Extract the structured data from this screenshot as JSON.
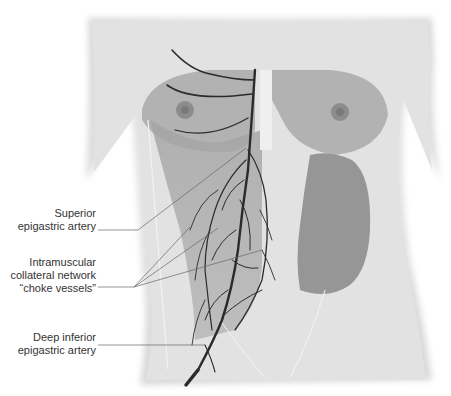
{
  "figure": {
    "colors": {
      "background": "#ffffff",
      "skin": "#e4e4e4",
      "muscle": "#9a9a9a",
      "muscle_dark": "#858585",
      "artery": "#2b2b2b",
      "leader_line": "#666666",
      "label_text": "#333333"
    }
  },
  "labels": [
    {
      "id": "superior",
      "lines": [
        "Superior",
        "epigastric artery"
      ]
    },
    {
      "id": "choke",
      "lines": [
        "Intramuscular",
        "collateral network",
        "“choke vessels”"
      ]
    },
    {
      "id": "deep",
      "lines": [
        "Deep inferior",
        "epigastric artery"
      ]
    }
  ]
}
